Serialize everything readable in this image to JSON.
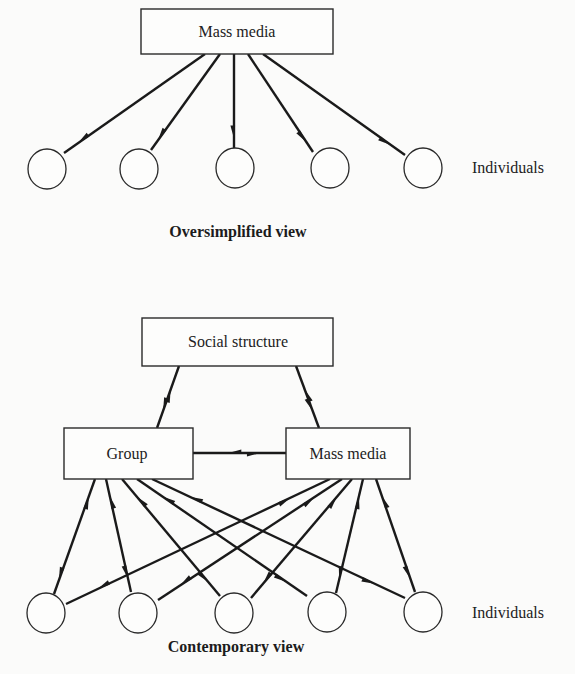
{
  "diagrams": [
    {
      "id": "oversimplified",
      "caption": "Oversimplified view",
      "nodes": [
        {
          "id": "media",
          "type": "box",
          "label": "Mass media"
        },
        {
          "id": "i1",
          "type": "circle",
          "label": ""
        },
        {
          "id": "i2",
          "type": "circle",
          "label": ""
        },
        {
          "id": "i3",
          "type": "circle",
          "label": ""
        },
        {
          "id": "i4",
          "type": "circle",
          "label": ""
        },
        {
          "id": "i5",
          "type": "circle",
          "label": ""
        }
      ],
      "row_label": "Individuals",
      "edges": [
        {
          "from": "media",
          "to": "i1",
          "direction": "forward"
        },
        {
          "from": "media",
          "to": "i2",
          "direction": "forward"
        },
        {
          "from": "media",
          "to": "i3",
          "direction": "forward"
        },
        {
          "from": "media",
          "to": "i4",
          "direction": "forward"
        },
        {
          "from": "media",
          "to": "i5",
          "direction": "forward"
        }
      ]
    },
    {
      "id": "contemporary",
      "caption": "Contemporary view",
      "nodes": [
        {
          "id": "social",
          "type": "box",
          "label": "Social structure"
        },
        {
          "id": "group",
          "type": "box",
          "label": "Group"
        },
        {
          "id": "media",
          "type": "box",
          "label": "Mass media"
        },
        {
          "id": "i1",
          "type": "circle",
          "label": ""
        },
        {
          "id": "i2",
          "type": "circle",
          "label": ""
        },
        {
          "id": "i3",
          "type": "circle",
          "label": ""
        },
        {
          "id": "i4",
          "type": "circle",
          "label": ""
        },
        {
          "id": "i5",
          "type": "circle",
          "label": ""
        }
      ],
      "row_label": "Individuals",
      "edges": [
        {
          "from": "social",
          "to": "group",
          "direction": "both"
        },
        {
          "from": "social",
          "to": "media",
          "direction": "both"
        },
        {
          "from": "group",
          "to": "media",
          "direction": "both"
        },
        {
          "from": "group",
          "to": "i1",
          "direction": "both"
        },
        {
          "from": "group",
          "to": "i2",
          "direction": "both"
        },
        {
          "from": "group",
          "to": "i3",
          "direction": "both"
        },
        {
          "from": "group",
          "to": "i4",
          "direction": "both"
        },
        {
          "from": "group",
          "to": "i5",
          "direction": "both"
        },
        {
          "from": "media",
          "to": "i1",
          "direction": "both"
        },
        {
          "from": "media",
          "to": "i2",
          "direction": "both"
        },
        {
          "from": "media",
          "to": "i3",
          "direction": "both"
        },
        {
          "from": "media",
          "to": "i4",
          "direction": "both"
        },
        {
          "from": "media",
          "to": "i5",
          "direction": "both"
        }
      ]
    }
  ]
}
